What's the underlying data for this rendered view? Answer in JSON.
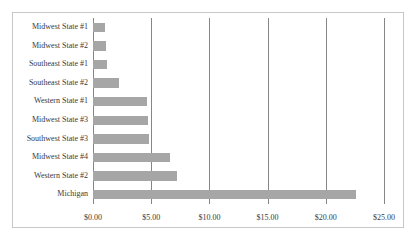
{
  "chart_data": {
    "type": "bar",
    "orientation": "horizontal",
    "title": "",
    "subtitle": "",
    "xlabel": "",
    "ylabel": "",
    "categories": [
      "Midwest State #1",
      "Midwest State #2",
      "Southeast State #1",
      "Southeast State #2",
      "Western State #1",
      "Midwest State #3",
      "Southwest State #3",
      "Midwest State #4",
      "Western State #2",
      "Michigan"
    ],
    "values": [
      1.0,
      1.1,
      1.2,
      2.2,
      4.6,
      4.7,
      4.8,
      6.6,
      7.2,
      22.6
    ],
    "xlim": [
      0,
      25
    ],
    "tick_values": [
      0,
      5,
      10,
      15,
      20,
      25
    ],
    "tick_labels": [
      "$0.00",
      "$5.00",
      "$10.00",
      "$15.00",
      "$20.00",
      "$25.00"
    ],
    "grid": "vertical",
    "legend": "none",
    "bar_color": "#a6a6a6",
    "gridline_color": "#868686",
    "border_color": "#c8c8c8"
  }
}
